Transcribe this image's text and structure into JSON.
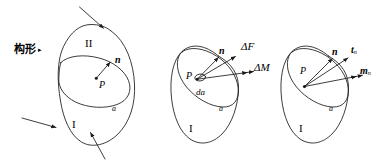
{
  "figure": {
    "caption_label": "构形",
    "caption_marker": "▸",
    "panels": [
      {
        "id": "panel-left",
        "regions": {
          "upper": "II",
          "lower": "I"
        },
        "surface_label": "a",
        "point_label": "P",
        "vectors": [
          {
            "name": "n",
            "label": "n",
            "kind": "normal",
            "arrowheads": 1
          }
        ],
        "incoming_arrows": 3
      },
      {
        "id": "panel-middle",
        "regions": {
          "lower": "I"
        },
        "surface_label": "a",
        "point_label": "P",
        "area_element_label": "da",
        "vectors": [
          {
            "name": "n",
            "label": "n",
            "kind": "normal",
            "arrowheads": 1
          },
          {
            "name": "delta-F",
            "label": "ΔF",
            "kind": "force",
            "arrowheads": 1
          },
          {
            "name": "delta-M",
            "label": "ΔM",
            "kind": "moment",
            "arrowheads": 2
          }
        ],
        "incoming_arrows": 0
      },
      {
        "id": "panel-right",
        "regions": {
          "lower": "I"
        },
        "surface_label": "a",
        "point_label": "P",
        "vectors": [
          {
            "name": "n",
            "label": "n",
            "kind": "normal",
            "arrowheads": 1
          },
          {
            "name": "t-n",
            "label": "t",
            "subscript": "n",
            "kind": "traction",
            "arrowheads": 1
          },
          {
            "name": "m-n",
            "label": "m",
            "subscript": "n",
            "kind": "couple",
            "arrowheads": 2
          }
        ],
        "incoming_arrows": 0
      }
    ],
    "colors": {
      "ink": "#1a1a1a",
      "background": "#ffffff"
    }
  }
}
